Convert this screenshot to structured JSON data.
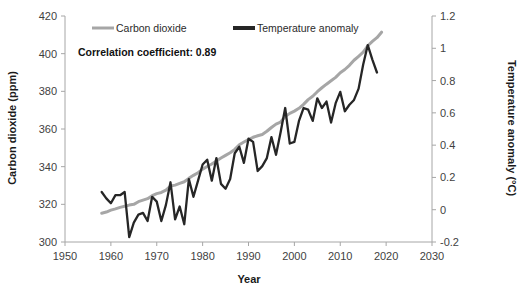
{
  "chart_data": {
    "type": "line",
    "title": "",
    "xlabel": "Year",
    "ylabel": "Carbon dioxide (ppm)",
    "y2label": "Temperature anomaly (°C)",
    "xlim": [
      1950,
      2030
    ],
    "ylim": [
      300,
      420
    ],
    "y2lim": [
      -0.2,
      1.2
    ],
    "xticks": [
      "1950",
      "1960",
      "1970",
      "1980",
      "1990",
      "2000",
      "2010",
      "2020",
      "2030"
    ],
    "yticks": [
      "300",
      "320",
      "340",
      "360",
      "380",
      "400",
      "420"
    ],
    "y2ticks": [
      "-0.2",
      "0",
      "0.2",
      "0.4",
      "0.6",
      "0.8",
      "1",
      "1.2"
    ],
    "grid": false,
    "legend_position": "top-center",
    "annotation": "Correlation coefficient: 0.89",
    "colors": {
      "carbon_dioxide": "#a6a6a6",
      "temperature_anomaly": "#262626",
      "axis": "#a6a6a6",
      "text": "#3f3f3f"
    },
    "series": [
      {
        "name": "Carbon dioxide",
        "axis": "left",
        "units": "ppm",
        "color": "#a6a6a6",
        "x": [
          1958,
          1959,
          1960,
          1961,
          1962,
          1963,
          1964,
          1965,
          1966,
          1967,
          1968,
          1969,
          1970,
          1971,
          1972,
          1973,
          1974,
          1975,
          1976,
          1977,
          1978,
          1979,
          1980,
          1981,
          1982,
          1983,
          1984,
          1985,
          1986,
          1987,
          1988,
          1989,
          1990,
          1991,
          1992,
          1993,
          1994,
          1995,
          1996,
          1997,
          1998,
          1999,
          2000,
          2001,
          2002,
          2003,
          2004,
          2005,
          2006,
          2007,
          2008,
          2009,
          2010,
          2011,
          2012,
          2013,
          2014,
          2015,
          2016,
          2017,
          2018,
          2019
        ],
        "values": [
          315.3,
          315.9,
          316.9,
          317.6,
          318.4,
          319.0,
          319.6,
          320.0,
          321.4,
          322.2,
          323.0,
          324.6,
          325.7,
          326.3,
          327.5,
          329.7,
          330.2,
          331.1,
          332.0,
          333.8,
          335.4,
          336.8,
          338.7,
          340.1,
          341.4,
          343.0,
          344.6,
          346.0,
          347.4,
          349.2,
          351.6,
          353.1,
          354.4,
          355.6,
          356.4,
          357.1,
          358.8,
          360.8,
          362.6,
          363.7,
          366.6,
          368.3,
          369.5,
          371.0,
          373.1,
          375.6,
          377.4,
          379.8,
          381.9,
          383.8,
          385.6,
          387.4,
          389.9,
          391.6,
          393.8,
          396.5,
          398.6,
          400.8,
          404.2,
          406.5,
          408.5,
          411.4
        ]
      },
      {
        "name": "Temperature anomaly",
        "axis": "right",
        "units": "°C",
        "color": "#262626",
        "x": [
          1958,
          1959,
          1960,
          1961,
          1962,
          1963,
          1964,
          1965,
          1966,
          1967,
          1968,
          1969,
          1970,
          1971,
          1972,
          1973,
          1974,
          1975,
          1976,
          1977,
          1978,
          1979,
          1980,
          1981,
          1982,
          1983,
          1984,
          1985,
          1986,
          1987,
          1988,
          1989,
          1990,
          1991,
          1992,
          1993,
          1994,
          1995,
          1996,
          1997,
          1998,
          1999,
          2000,
          2001,
          2002,
          2003,
          2004,
          2005,
          2006,
          2007,
          2008,
          2009,
          2010,
          2011,
          2012,
          2013,
          2014,
          2015,
          2016,
          2017,
          2018
        ],
        "values": [
          0.11,
          0.07,
          0.04,
          0.09,
          0.09,
          0.11,
          -0.17,
          -0.08,
          -0.03,
          -0.02,
          -0.07,
          0.08,
          0.05,
          -0.07,
          0.03,
          0.17,
          -0.06,
          0.02,
          -0.09,
          0.19,
          0.08,
          0.18,
          0.28,
          0.31,
          0.18,
          0.32,
          0.16,
          0.13,
          0.19,
          0.35,
          0.39,
          0.29,
          0.44,
          0.42,
          0.24,
          0.27,
          0.32,
          0.45,
          0.34,
          0.48,
          0.63,
          0.41,
          0.42,
          0.55,
          0.63,
          0.62,
          0.55,
          0.69,
          0.63,
          0.67,
          0.54,
          0.66,
          0.73,
          0.61,
          0.65,
          0.68,
          0.75,
          0.9,
          1.02,
          0.93,
          0.85
        ]
      }
    ]
  },
  "legend": {
    "items": [
      {
        "label": "Carbon dioxide",
        "color": "#a6a6a6",
        "thickness": 3
      },
      {
        "label": "Temperature anomaly",
        "color": "#262626",
        "thickness": 4
      }
    ]
  }
}
